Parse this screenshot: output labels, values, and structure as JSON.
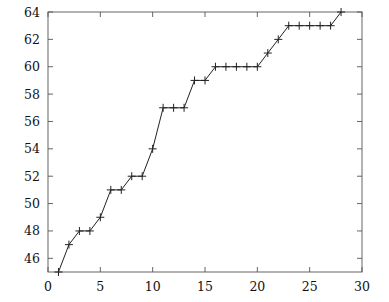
{
  "chart_data": {
    "type": "line",
    "title": "",
    "subtitle": "",
    "xlabel": "",
    "ylabel": "",
    "xlim": [
      0,
      30
    ],
    "ylim": [
      45,
      64
    ],
    "xticks": [
      0,
      5,
      10,
      15,
      20,
      25,
      30
    ],
    "yticks": [
      46,
      48,
      50,
      52,
      54,
      56,
      58,
      60,
      62,
      64
    ],
    "xtick_labels": [
      "0",
      "5",
      "10",
      "15",
      "20",
      "25",
      "30"
    ],
    "ytick_labels": [
      "46",
      "48",
      "50",
      "52",
      "54",
      "56",
      "58",
      "60",
      "62",
      "64"
    ],
    "grid": false,
    "legend": null,
    "legend_position": "none",
    "marker": "plus",
    "line_color": "#222222",
    "axis_color": "#555555",
    "series": [
      {
        "name": "series-1",
        "x": [
          1,
          2,
          3,
          4,
          5,
          6,
          7,
          8,
          9,
          10,
          11,
          12,
          13,
          14,
          15,
          16,
          17,
          18,
          19,
          20,
          21,
          22,
          23,
          24,
          25,
          26,
          27,
          28
        ],
        "values": [
          45,
          47,
          48,
          48,
          49,
          51,
          51,
          52,
          52,
          54,
          57,
          57,
          57,
          59,
          59,
          60,
          60,
          60,
          60,
          60,
          61,
          62,
          63,
          63,
          63,
          63,
          63,
          64
        ]
      }
    ]
  },
  "geometry": {
    "plot_left_px": 48,
    "plot_right_px": 362,
    "plot_top_px": 12,
    "plot_bottom_px": 272,
    "marker_half_px": 4
  }
}
